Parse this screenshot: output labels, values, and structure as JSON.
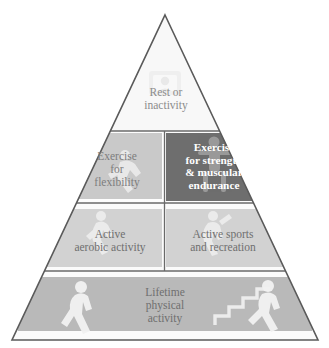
{
  "diagram": {
    "shape": "triangle",
    "colors": {
      "outline": "#5a5a5a",
      "apex_fill": "#f7f7f7",
      "tier2_left_fill": "#c9c9c9",
      "tier2_right_fill": "#6e6e6e",
      "tier3_fill": "#d2d2d2",
      "tier4_fill": "#b9b9b9",
      "figure_fill": "#f2f2f2",
      "text_gray": "#7d7d7d",
      "text_white": "#ffffff"
    },
    "tiers": [
      {
        "level": 1,
        "name": "apex",
        "cells": [
          {
            "id": "rest",
            "label": "Rest or\ninactivity",
            "icon": "television-icon",
            "fill": "#f7f7f7",
            "text_color": "#8c8c8c",
            "bold": false
          }
        ]
      },
      {
        "level": 2,
        "name": "upper-middle",
        "cells": [
          {
            "id": "flexibility",
            "label": "Exercise\nfor\nflexibility",
            "icon": "stretching-figure-icon",
            "fill": "#c9c9c9",
            "text_color": "#7d7d7d",
            "bold": false
          },
          {
            "id": "strength",
            "label": "Exercise\nfor strength\n& muscular\nendurance",
            "icon": "weightlifting-figure-icon",
            "fill": "#6e6e6e",
            "text_color": "#ffffff",
            "bold": true
          }
        ]
      },
      {
        "level": 3,
        "name": "lower-middle",
        "cells": [
          {
            "id": "aerobic",
            "label": "Active\naerobic activity",
            "icon": "running-figure-icon",
            "fill": "#d2d2d2",
            "text_color": "#6f6f6f",
            "bold": false
          },
          {
            "id": "sports",
            "label": "Active sports\nand recreation",
            "icon": "tennis-figure-icon",
            "fill": "#d2d2d2",
            "text_color": "#6f6f6f",
            "bold": false
          }
        ]
      },
      {
        "level": 4,
        "name": "base",
        "cells": [
          {
            "id": "lifetime",
            "label": "Lifetime\nphysical\nactivity",
            "icons": [
              "walking-figure-icon",
              "stair-climbing-figure-icon"
            ],
            "fill": "#b9b9b9",
            "text_color": "#6f6f6f",
            "bold": false
          }
        ]
      }
    ]
  }
}
